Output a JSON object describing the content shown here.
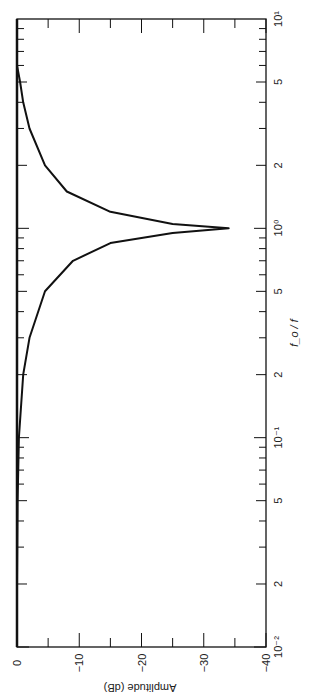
{
  "chart_data": {
    "type": "line",
    "orientation": "rotated-90-clockwise",
    "title": "",
    "xlabel": "f_o / f",
    "ylabel": "Amplitude (dB)",
    "xscale": "log",
    "xlim": [
      0.01,
      10
    ],
    "ylim": [
      -40,
      0
    ],
    "x_ticks": [
      "10^-2",
      "2",
      "5",
      "10^-1",
      "2",
      "5",
      "10^0",
      "2",
      "5",
      "10^1"
    ],
    "y_ticks": [
      "0",
      "-10",
      "-20",
      "-30",
      "-40"
    ],
    "grid": false,
    "series": [
      {
        "name": "amplitude response",
        "x": [
          0.01,
          0.02,
          0.05,
          0.1,
          0.2,
          0.3,
          0.5,
          0.7,
          0.85,
          0.95,
          1.0,
          1.05,
          1.2,
          1.5,
          2,
          3,
          4,
          5,
          6
        ],
        "y": [
          0,
          0,
          -0.1,
          -0.3,
          -1.0,
          -2.0,
          -4.5,
          -9,
          -15,
          -25,
          -34,
          -25,
          -15,
          -8,
          -4.5,
          -2.0,
          -1.0,
          -0.5,
          0
        ]
      }
    ]
  },
  "labels": {
    "x_axis_title": "f_o / f",
    "y_axis_title": "Amplitude (dB)"
  }
}
